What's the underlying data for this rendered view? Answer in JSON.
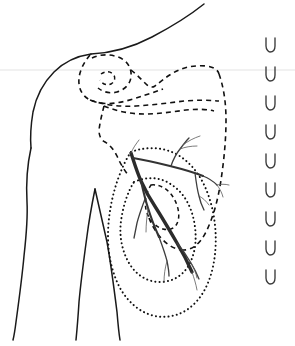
{
  "figure": {
    "width": 295,
    "height": 346,
    "background_color": "#ffffff",
    "line_color": "#111111",
    "vessel_color": "#2b2b2b",
    "guide_color": "#e3e3e3"
  },
  "guide": {
    "name": "horizontal-reference-line",
    "y": 70,
    "color": "#e3e3e3"
  },
  "body_outline": {
    "name": "torso-and-arm-outline",
    "style": "solid",
    "parts": [
      {
        "name": "raised-arm-upper-border",
        "d": "M91 54 C112 53 133 47 152 37 C171 27 189 16 204 4"
      },
      {
        "name": "neck-shoulder-contour",
        "d": "M91 54 C77 56 64 62 54 72 C43 83 36 97 33 112 C31 124 30 136 31 148"
      },
      {
        "name": "outer-arm-contour",
        "d": "M31 148 C27 166 26 184 27 202 C28 220 26 238 24 256 C22 278 19 300 16 322 C15 330 14 336 13 340"
      },
      {
        "name": "inner-arm-front-contour",
        "d": "M95 189 C92 204 89 220 87 236 C84 258 81 280 79 302 C78 318 77 330 76 340"
      },
      {
        "name": "inner-arm-back-contour",
        "d": "M95 189 C99 206 103 224 107 242 C111 264 114 288 117 312 C118 324 119 334 120 340"
      }
    ]
  },
  "bone_outlines": {
    "name": "dashed-bone-silhouettes",
    "style": "dashed",
    "parts": [
      {
        "name": "clavicle-outline",
        "d": "M90 55 C84 62 80 70 79 78 C78 88 82 96 90 100 C100 105 114 104 126 101 C140 97 152 93 163 89"
      },
      {
        "name": "humeral-head-outline",
        "d": "M92 58 C100 54 110 54 118 57 C127 60 132 68 131 77 C130 85 124 90 117 92 C110 94 103 92 98 88"
      },
      {
        "name": "humeral-head-inner-notch",
        "d": "M101 74 C105 71 110 71 113 74 C116 77 115 82 111 84 C107 86 102 84 100 80"
      },
      {
        "name": "acromion-coracoid-outline",
        "d": "M131 70 C136 74 141 79 146 84 C149 87 152 88 155 86 C160 82 166 77 173 73 C183 67 195 65 206 66 C214 67 218 70 219 74"
      },
      {
        "name": "scapula-superior-border",
        "d": "M90 100 C104 105 120 107 136 106 C152 105 168 103 184 101 C196 100 208 100 219 101"
      },
      {
        "name": "scapula-second-border",
        "d": "M104 106 C116 111 130 114 144 114 C158 114 172 112 186 110 C196 109 206 109 214 111"
      },
      {
        "name": "ribcage-lateral-outline",
        "d": "M219 74 C224 88 226 104 226 120 C226 140 224 160 221 180 C218 200 213 218 206 232 C200 244 192 250 184 250"
      },
      {
        "name": "thoracic-medial-outline",
        "d": "M104 106 C102 114 100 122 99 130 C99 136 101 140 105 142 C110 145 114 150 117 156 C120 163 124 170 129 176"
      },
      {
        "name": "lower-scapula-tip",
        "d": "M184 250 C176 250 169 246 163 240 C157 234 152 226 149 218"
      }
    ]
  },
  "lesion_outlines": {
    "name": "dotted-radiation-field-contours",
    "style": "dotted",
    "parts": [
      {
        "name": "outer-field-contour",
        "d": "M131 152 C147 146 164 147 178 155 C193 164 203 179 209 197 C215 215 217 235 215 254 C213 273 207 290 196 302 C185 314 170 319 155 316 C140 313 128 302 120 288 C112 273 108 255 108 236 C108 216 112 196 118 179 C122 168 126 159 131 152 Z"
      },
      {
        "name": "inner-field-contour",
        "d": "M134 182 C147 176 161 177 172 185 C184 193 191 206 194 221 C197 236 196 251 190 263 C184 275 173 282 160 282 C147 282 136 275 129 263 C122 251 119 236 121 221 C123 206 128 191 134 182 Z"
      },
      {
        "name": "small-nodal-contour",
        "d": "M151 185 C160 184 168 189 173 197 C178 205 180 214 178 221 C176 228 170 231 163 229 C156 227 150 221 147 213 C144 205 145 194 151 185 Z"
      }
    ]
  },
  "vascular_tree": {
    "name": "axillary-vessel-and-nerve-tree",
    "color": "#2b2b2b",
    "trunk": {
      "name": "main-trunk",
      "d": "M131 153 C134 162 137 172 141 181 C145 190 150 199 156 208 C163 219 170 231 177 243 C183 253 188 263 192 272"
    },
    "branches": [
      {
        "name": "upper-lateral-branch",
        "width": "mid",
        "d": "M133 158 C145 160 158 163 170 166 C182 169 193 172 203 176"
      },
      {
        "name": "upper-ascending-branch",
        "width": "small",
        "d": "M171 166 C173 160 176 154 180 149 C183 145 186 141 189 138"
      },
      {
        "name": "upper-ascending-twig-a",
        "width": "fine",
        "d": "M180 149 C185 147 191 146 197 146"
      },
      {
        "name": "upper-ascending-twig-b",
        "width": "fine",
        "d": "M183 145 C188 141 194 138 200 136"
      },
      {
        "name": "lateral-terminal-branch",
        "width": "small",
        "d": "M203 176 C208 178 213 181 217 185"
      },
      {
        "name": "lateral-terminal-twig-a",
        "width": "fine",
        "d": "M217 185 C221 184 225 184 229 185"
      },
      {
        "name": "lateral-terminal-twig-b",
        "width": "fine",
        "d": "M217 185 C220 189 222 193 223 197"
      },
      {
        "name": "mid-descending-branch",
        "width": "small",
        "d": "M195 173 C196 181 197 189 199 196 C200 201 202 206 204 210"
      },
      {
        "name": "mid-descending-twig",
        "width": "fine",
        "d": "M199 196 C203 198 206 201 209 205"
      },
      {
        "name": "medial-descending-branch",
        "width": "mid",
        "d": "M141 181 C143 190 145 199 148 208 C151 218 155 228 159 237"
      },
      {
        "name": "medial-descending-twig-a",
        "width": "small",
        "d": "M145 199 C142 207 139 215 137 223 C136 228 135 233 134 238"
      },
      {
        "name": "medial-descending-twig-b",
        "width": "fine",
        "d": "M148 208 C147 216 146 224 146 232"
      },
      {
        "name": "inferior-branch-a",
        "width": "small",
        "d": "M159 237 C162 245 165 253 167 261 C168 266 169 271 169 276"
      },
      {
        "name": "inferior-branch-b",
        "width": "small",
        "d": "M177 243 C182 249 187 256 191 263 C194 268 197 274 199 279"
      },
      {
        "name": "inferior-twig-a",
        "width": "fine",
        "d": "M167 261 C165 268 164 275 164 282"
      },
      {
        "name": "inferior-twig-b",
        "width": "fine",
        "d": "M191 263 C194 268 196 273 197 278"
      },
      {
        "name": "terminal-twig-inferior",
        "width": "fine",
        "d": "M192 272 C194 278 196 284 197 290"
      },
      {
        "name": "proximal-superior-twig",
        "width": "fine",
        "d": "M131 153 C133 148 136 144 139 140"
      }
    ]
  },
  "markers": {
    "name": "vertebral-level-marker-column",
    "glyph": "u-marker-icon",
    "x": 270,
    "count": 9,
    "items": [
      {
        "name": "marker-1",
        "y": 44
      },
      {
        "name": "marker-2",
        "y": 73
      },
      {
        "name": "marker-3",
        "y": 102
      },
      {
        "name": "marker-4",
        "y": 131
      },
      {
        "name": "marker-5",
        "y": 160
      },
      {
        "name": "marker-6",
        "y": 189
      },
      {
        "name": "marker-7",
        "y": 218
      },
      {
        "name": "marker-8",
        "y": 247
      },
      {
        "name": "marker-9",
        "y": 276
      }
    ]
  }
}
